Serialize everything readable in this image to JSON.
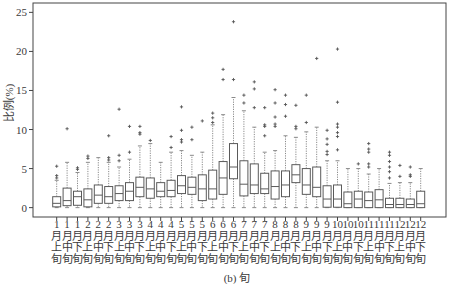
{
  "caption": "(b) 旬",
  "chart_data": {
    "type": "boxplot",
    "title": "",
    "xlabel": "",
    "ylabel": "比例(%)",
    "ylim": [
      -1.2,
      26.2
    ],
    "yticks": [
      0,
      5,
      10,
      15,
      20,
      25
    ],
    "grid": false,
    "legend": null,
    "colors": {
      "frame": "#444444",
      "box": "#5a5a5a",
      "median": "#5a5a5a",
      "whisker": "#8a8a8a",
      "outlier": "#555555",
      "text": "#3a3a3a"
    },
    "categories": [
      "1月上旬",
      "1月中旬",
      "1月下旬",
      "2月上旬",
      "2月中旬",
      "2月下旬",
      "3月上旬",
      "3月中旬",
      "3月下旬",
      "4月上旬",
      "4月中旬",
      "4月下旬",
      "5月上旬",
      "5月中旬",
      "5月下旬",
      "6月上旬",
      "6月中旬",
      "6月下旬",
      "7月上旬",
      "7月中旬",
      "7月下旬",
      "8月上旬",
      "8月中旬",
      "8月下旬",
      "9月上旬",
      "9月中旬",
      "9月下旬",
      "10月上旬",
      "10月中旬",
      "10月下旬",
      "11月上旬",
      "11月中旬",
      "11月下旬",
      "12月上旬",
      "12月中旬",
      "12月下旬"
    ],
    "series": [
      {
        "name": "比例(%)",
        "stats": [
          {
            "min": 0,
            "q1": 0.1,
            "median": 0.55,
            "q3": 1.4,
            "max": 3.5,
            "outliers": [
              3.8,
              4.1,
              5.3
            ]
          },
          {
            "min": 0,
            "q1": 0.25,
            "median": 0.9,
            "q3": 2.5,
            "max": 5.8,
            "outliers": [
              10.1
            ]
          },
          {
            "min": 0,
            "q1": 0.3,
            "median": 1.4,
            "q3": 2.1,
            "max": 4.5,
            "outliers": [
              4.9,
              5.1
            ]
          },
          {
            "min": 0,
            "q1": 0.1,
            "median": 1.0,
            "q3": 2.4,
            "max": 5.8,
            "outliers": [
              6.3,
              6.6
            ]
          },
          {
            "min": 0,
            "q1": 0.55,
            "median": 1.6,
            "q3": 2.9,
            "max": 6.4,
            "outliers": []
          },
          {
            "min": 0,
            "q1": 0.55,
            "median": 1.4,
            "q3": 2.7,
            "max": 5.8,
            "outliers": [
              6.1,
              6.4,
              9.2
            ]
          },
          {
            "min": 0,
            "q1": 0.9,
            "median": 1.8,
            "q3": 2.8,
            "max": 5.2,
            "outliers": [
              6.0,
              6.7,
              12.6
            ]
          },
          {
            "min": 0,
            "q1": 0.9,
            "median": 2.1,
            "q3": 3.2,
            "max": 6.2,
            "outliers": [
              7.1,
              10.4
            ]
          },
          {
            "min": 0,
            "q1": 1.4,
            "median": 2.6,
            "q3": 3.9,
            "max": 7.9,
            "outliers": [
              9.4,
              9.6,
              10.4
            ]
          },
          {
            "min": 0,
            "q1": 1.2,
            "median": 2.4,
            "q3": 3.8,
            "max": 8.2,
            "outliers": [
              8.6
            ]
          },
          {
            "min": 0,
            "q1": 1.4,
            "median": 2.1,
            "q3": 3.2,
            "max": 5.8,
            "outliers": []
          },
          {
            "min": 0,
            "q1": 1.4,
            "median": 2.2,
            "q3": 3.5,
            "max": 7.1,
            "outliers": [
              7.7,
              9.1
            ]
          },
          {
            "min": 0,
            "q1": 1.8,
            "median": 2.8,
            "q3": 4.1,
            "max": 7.3,
            "outliers": [
              8.4,
              8.7,
              9.9,
              12.9
            ]
          },
          {
            "min": 0,
            "q1": 1.7,
            "median": 2.6,
            "q3": 3.9,
            "max": 6.7,
            "outliers": [
              8.7,
              10.3
            ]
          },
          {
            "min": 0,
            "q1": 0.9,
            "median": 2.4,
            "q3": 4.2,
            "max": 7.1,
            "outliers": [
              11.1
            ]
          },
          {
            "min": 0,
            "q1": 1.1,
            "median": 2.4,
            "q3": 4.8,
            "max": 10.6,
            "outliers": [
              10.9,
              11.5,
              12.1
            ]
          },
          {
            "min": 0,
            "q1": 1.7,
            "median": 3.8,
            "q3": 5.9,
            "max": 11.9,
            "outliers": [
              16.4,
              17.7
            ]
          },
          {
            "min": 0,
            "q1": 3.7,
            "median": 5.2,
            "q3": 8.2,
            "max": 14.1,
            "outliers": [
              16.4,
              23.8
            ]
          },
          {
            "min": 0,
            "q1": 1.5,
            "median": 3.0,
            "q3": 6.0,
            "max": 12.4,
            "outliers": [
              13.4,
              14.4
            ]
          },
          {
            "min": 0,
            "q1": 1.8,
            "median": 2.9,
            "q3": 5.6,
            "max": 10.3,
            "outliers": [
              12.8,
              15.2,
              16.1
            ]
          },
          {
            "min": 0,
            "q1": 1.8,
            "median": 2.4,
            "q3": 4.4,
            "max": 7.1,
            "outliers": [
              9.2,
              10.4,
              10.6,
              12.8
            ]
          },
          {
            "min": 0,
            "q1": 1.1,
            "median": 2.7,
            "q3": 4.7,
            "max": 7.3,
            "outliers": [
              10.4,
              10.7,
              11.6,
              13.4,
              15.1
            ]
          },
          {
            "min": 0,
            "q1": 1.4,
            "median": 2.9,
            "q3": 4.7,
            "max": 9.2,
            "outliers": [
              11.7,
              13.2,
              14.4
            ]
          },
          {
            "min": 0,
            "q1": 3.2,
            "median": 4.2,
            "q3": 5.5,
            "max": 9.0,
            "outliers": [
              10.1,
              10.4,
              13.1
            ]
          },
          {
            "min": 0,
            "q1": 1.7,
            "median": 2.9,
            "q3": 5.0,
            "max": 9.7,
            "outliers": [
              10.9,
              14.4
            ]
          },
          {
            "min": 0,
            "q1": 1.4,
            "median": 2.6,
            "q3": 5.2,
            "max": 10.3,
            "outliers": [
              19.1
            ]
          },
          {
            "min": 0,
            "q1": 0.05,
            "median": 1.1,
            "q3": 2.8,
            "max": 6.0,
            "outliers": [
              6.8,
              7.2,
              8.1,
              8.8,
              9.9
            ]
          },
          {
            "min": 0,
            "q1": 0.05,
            "median": 1.1,
            "q3": 2.9,
            "max": 6.0,
            "outliers": [
              7.4,
              9.1,
              9.6,
              10.3,
              10.7,
              13.5,
              20.3
            ]
          },
          {
            "min": 0,
            "q1": 0,
            "median": 0.5,
            "q3": 2.0,
            "max": 5.0,
            "outliers": []
          },
          {
            "min": 0,
            "q1": 0,
            "median": 1.1,
            "q3": 2.1,
            "max": 5.0,
            "outliers": [
              5.6
            ]
          },
          {
            "min": 0,
            "q1": 0,
            "median": 0.9,
            "q3": 2.0,
            "max": 4.3,
            "outliers": [
              5.2,
              5.6,
              7.1,
              7.5,
              8.2
            ]
          },
          {
            "min": 0,
            "q1": 0,
            "median": 1.0,
            "q3": 2.3,
            "max": 5.0,
            "outliers": []
          },
          {
            "min": 0,
            "q1": 0,
            "median": 0.4,
            "q3": 1.2,
            "max": 3.1,
            "outliers": [
              3.8,
              4.6,
              5.2,
              5.9,
              6.7,
              7.1
            ]
          },
          {
            "min": 0,
            "q1": 0,
            "median": 0.4,
            "q3": 1.2,
            "max": 3.2,
            "outliers": [
              4.0,
              5.4
            ]
          },
          {
            "min": 0,
            "q1": 0,
            "median": 0.4,
            "q3": 1.1,
            "max": 3.2,
            "outliers": [
              4.0,
              4.2,
              5.2
            ]
          },
          {
            "min": 0,
            "q1": 0,
            "median": 0.5,
            "q3": 2.1,
            "max": 5.0,
            "outliers": []
          }
        ]
      }
    ]
  }
}
